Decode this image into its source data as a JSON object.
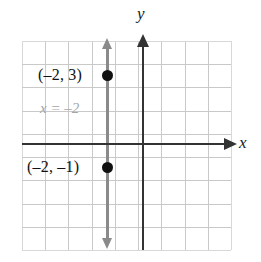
{
  "figure": {
    "background_color": "#ffffff",
    "axis_color": "#333333",
    "grid_color": "#c9c9c9",
    "line_color": "#8a8a8a",
    "point_color": "#111111",
    "equation_text_color": "#a6a6a6",
    "axes": {
      "x_label": "x",
      "y_label": "y"
    },
    "equation_label": "x = –2",
    "points": [
      {
        "label": "(–2, 3)",
        "x": -2,
        "y": 3
      },
      {
        "label": "(–2, –1)",
        "x": -2,
        "y": -1
      }
    ]
  },
  "chart_data": {
    "type": "scatter",
    "title": "",
    "xlabel": "x",
    "ylabel": "y",
    "xlim": [
      -5,
      4
    ],
    "ylim": [
      -5,
      4
    ],
    "grid": true,
    "legend": null,
    "series": [
      {
        "name": "plotted points",
        "points": [
          {
            "x": -2,
            "y": 3,
            "label": "(–2, 3)"
          },
          {
            "x": -2,
            "y": -1,
            "label": "(–2, –1)"
          }
        ]
      },
      {
        "name": "x = –2",
        "type": "line",
        "equation": "x = -2",
        "annotation": "x = –2",
        "x": [
          -2,
          -2
        ],
        "y": [
          -4.5,
          4.5
        ],
        "arrows": "both"
      }
    ],
    "grid_cells": {
      "columns": 9,
      "rows": 9
    },
    "gridlines_x": [
      -5,
      -4,
      -3,
      -2,
      -1,
      0,
      1,
      2,
      3,
      4
    ],
    "gridlines_y": [
      -5,
      -4,
      -3,
      -2,
      -1,
      0,
      1,
      2,
      3,
      4
    ]
  }
}
